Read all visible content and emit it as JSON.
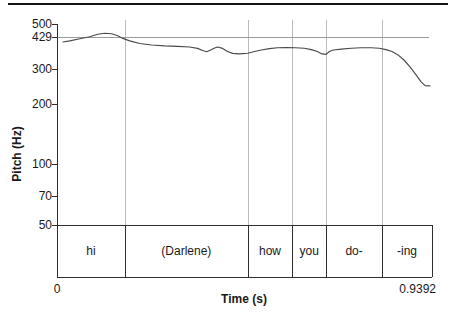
{
  "chart_data": {
    "type": "line",
    "title": "",
    "xlabel": "Time (s)",
    "ylabel": "Pitch (Hz)",
    "x_range": [
      0,
      0.9392
    ],
    "x_start_label": "0",
    "x_end_label": "0.9392",
    "y_scale": "log",
    "y_range": [
      50,
      500
    ],
    "yticks": [
      500,
      429,
      300,
      200,
      100,
      70,
      50
    ],
    "reference_line_hz": 429,
    "grid": "off",
    "legend": "none",
    "series": [
      {
        "name": "pitch-contour",
        "unit": "Hz",
        "points": [
          [
            0.015,
            407
          ],
          [
            0.032,
            412
          ],
          [
            0.057,
            422
          ],
          [
            0.082,
            432
          ],
          [
            0.102,
            445
          ],
          [
            0.12,
            450
          ],
          [
            0.137,
            447
          ],
          [
            0.152,
            437
          ],
          [
            0.165,
            424
          ],
          [
            0.182,
            412
          ],
          [
            0.207,
            400
          ],
          [
            0.237,
            393
          ],
          [
            0.27,
            389
          ],
          [
            0.302,
            387
          ],
          [
            0.332,
            384
          ],
          [
            0.352,
            378
          ],
          [
            0.365,
            369
          ],
          [
            0.375,
            364
          ],
          [
            0.385,
            371
          ],
          [
            0.395,
            380
          ],
          [
            0.402,
            384
          ],
          [
            0.415,
            378
          ],
          [
            0.427,
            365
          ],
          [
            0.44,
            357
          ],
          [
            0.457,
            355
          ],
          [
            0.477,
            358
          ],
          [
            0.495,
            365
          ],
          [
            0.512,
            371
          ],
          [
            0.532,
            377
          ],
          [
            0.552,
            381
          ],
          [
            0.574,
            382
          ],
          [
            0.597,
            381
          ],
          [
            0.619,
            379
          ],
          [
            0.637,
            373
          ],
          [
            0.652,
            365
          ],
          [
            0.664,
            355
          ],
          [
            0.674,
            353
          ],
          [
            0.682,
            365
          ],
          [
            0.692,
            371
          ],
          [
            0.712,
            375
          ],
          [
            0.737,
            379
          ],
          [
            0.762,
            381
          ],
          [
            0.787,
            381
          ],
          [
            0.807,
            379
          ],
          [
            0.824,
            373
          ],
          [
            0.839,
            365
          ],
          [
            0.854,
            351
          ],
          [
            0.869,
            331
          ],
          [
            0.884,
            306
          ],
          [
            0.899,
            280
          ],
          [
            0.912,
            258
          ],
          [
            0.922,
            247
          ],
          [
            0.934,
            246
          ]
        ]
      }
    ],
    "textgrid_intervals": [
      {
        "label": "hi",
        "tmin": 0,
        "tmax": 0.17
      },
      {
        "label": "(Darlene)",
        "tmin": 0.17,
        "tmax": 0.478
      },
      {
        "label": "how",
        "tmin": 0.478,
        "tmax": 0.589
      },
      {
        "label": "you",
        "tmin": 0.589,
        "tmax": 0.674
      },
      {
        "label": "do-",
        "tmin": 0.674,
        "tmax": 0.814
      },
      {
        "label": "-ing",
        "tmin": 0.814,
        "tmax": 0.9392
      }
    ]
  },
  "colors": {
    "curve": "#4a4a4a",
    "reference_line": "#9a9a9a",
    "boundary_line": "#bbbbbb",
    "frame": "#2e2e2e",
    "top_rule": "#141414"
  }
}
